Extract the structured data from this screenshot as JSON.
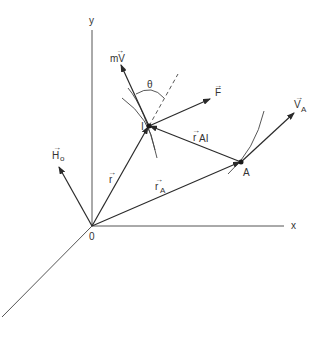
{
  "diagram": {
    "axes": {
      "x_label": "x",
      "y_label": "y",
      "origin_label": "0"
    },
    "points": {
      "I_label": "I",
      "A_label": "A"
    },
    "vectors": {
      "mV": {
        "base": "mV",
        "arrow": "→"
      },
      "F": {
        "base": "F",
        "arrow": "→"
      },
      "VA": {
        "base": "V",
        "sub": "A",
        "arrow": "→"
      },
      "rAI": {
        "base": "r",
        "sub": "AI",
        "arrow": "→"
      },
      "r": {
        "base": "r",
        "arrow": "→"
      },
      "rA": {
        "base": "r",
        "sub": "A",
        "arrow": "→"
      },
      "Ho": {
        "base": "H",
        "sub": "o",
        "arrow": "→"
      }
    },
    "angle_label": "θ",
    "colors": {
      "line": "#2a2a2a",
      "background": "#ffffff"
    }
  }
}
